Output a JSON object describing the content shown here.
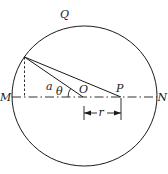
{
  "diagram": {
    "labels": {
      "top": "Q",
      "left": "M",
      "right": "N",
      "radius_label": "a",
      "angle": "θ",
      "center": "O",
      "point": "P",
      "distance": "r"
    },
    "colors": {
      "stroke": "#1a1a1a",
      "background": "#ffffff"
    }
  }
}
